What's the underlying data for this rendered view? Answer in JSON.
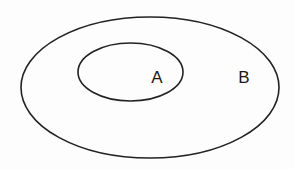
{
  "diagram": {
    "type": "venn-subset",
    "sets": [
      {
        "id": "B",
        "label": "B",
        "role": "outer",
        "shape": {
          "cx": 150,
          "cy": 87.5,
          "rx": 129,
          "ry": 70.5
        },
        "label_pos": {
          "x": 244,
          "y": 83
        }
      },
      {
        "id": "A",
        "label": "A",
        "role": "inner",
        "shape": {
          "cx": 130.5,
          "cy": 72,
          "rx": 52.5,
          "ry": 29
        },
        "label_pos": {
          "x": 157,
          "y": 83
        }
      }
    ],
    "relationship": "A is a subset of B",
    "stroke_color": "#222222",
    "background_color": "#ffffff"
  }
}
